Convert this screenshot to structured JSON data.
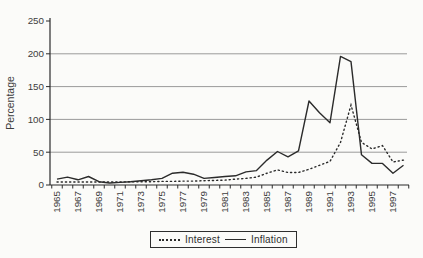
{
  "chart": {
    "title": "",
    "legend_border": "#2e2e2e",
    "line_color": "#2b2b2b",
    "grid_color": "#9a9a9a",
    "text_color": "#3d3d3d"
  },
  "chart_data": {
    "type": "line",
    "title": "",
    "xlabel": "",
    "ylabel": "Percentage",
    "ylim": [
      0,
      250
    ],
    "y_ticks": [
      0,
      50,
      100,
      150,
      200,
      250
    ],
    "grid": "horizontal",
    "legend_position": "bottom",
    "x": [
      1965,
      1966,
      1967,
      1968,
      1969,
      1970,
      1971,
      1972,
      1973,
      1974,
      1975,
      1976,
      1977,
      1978,
      1979,
      1980,
      1981,
      1982,
      1983,
      1984,
      1985,
      1986,
      1987,
      1988,
      1989,
      1990,
      1991,
      1992,
      1993,
      1994,
      1995,
      1996,
      1997,
      1998
    ],
    "x_tick_labels": [
      "1965",
      "1967",
      "1969",
      "1971",
      "1973",
      "1975",
      "1977",
      "1979",
      "1981",
      "1983",
      "1985",
      "1987",
      "1989",
      "1991",
      "1993",
      "1995",
      "1997"
    ],
    "series": [
      {
        "name": "Interest",
        "style": "dotted",
        "values": [
          4.5,
          4.5,
          4.5,
          4.5,
          4.5,
          4.5,
          4.5,
          5,
          5,
          5,
          5.5,
          5.5,
          6,
          6,
          6.5,
          7,
          7.5,
          9,
          10,
          12,
          18,
          23,
          19,
          19,
          24,
          30,
          36,
          65,
          122,
          65,
          55,
          60,
          35,
          38
        ]
      },
      {
        "name": "Inflation",
        "style": "solid",
        "values": [
          9,
          12,
          8,
          13,
          5,
          3,
          4,
          5,
          6.5,
          8,
          10,
          18,
          19.5,
          16.5,
          10,
          11.5,
          13,
          14,
          20,
          22,
          38,
          51,
          43,
          52,
          128,
          110,
          95,
          196,
          188,
          46,
          33,
          33,
          18,
          30
        ]
      }
    ]
  }
}
